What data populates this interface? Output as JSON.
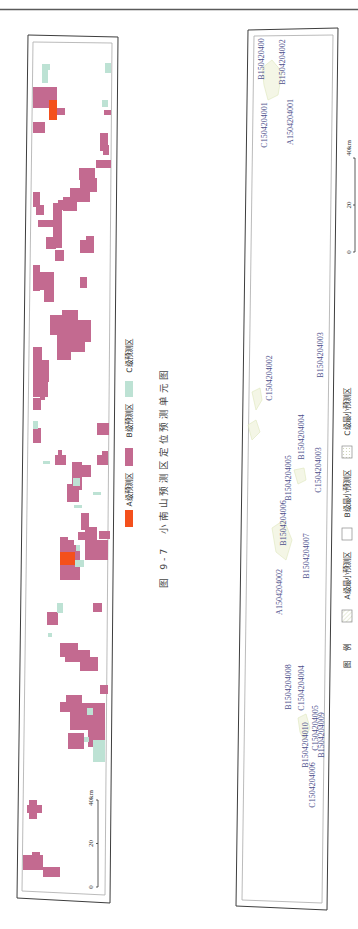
{
  "figure": {
    "number": "图 9-7",
    "title": "小南山预测区定位预测单元图"
  },
  "colors": {
    "A": "#f4501c",
    "B": "#c36a90",
    "C": "#bde2d4",
    "unit_label": "#4d508c",
    "hatch_stroke": "#d9e2b0",
    "hatch_fill": "#f1f4de",
    "box_empty": "#ffffff"
  },
  "left_map": {
    "legend": [
      {
        "key": "A",
        "label": "A级预测区"
      },
      {
        "key": "B",
        "label": "B级预测区"
      },
      {
        "key": "C",
        "label": "C级预测区"
      }
    ],
    "scale": {
      "min": "0",
      "mid": "20",
      "max": "40km"
    },
    "cells": [
      [
        33,
        87,
        24,
        21,
        "B"
      ],
      [
        57,
        108,
        8,
        7,
        "B"
      ],
      [
        104,
        110,
        7,
        5,
        "B"
      ],
      [
        33,
        122,
        12,
        11,
        "B"
      ],
      [
        100,
        133,
        8,
        18,
        "B"
      ],
      [
        103,
        145,
        6,
        10,
        "B"
      ],
      [
        96,
        160,
        15,
        8,
        "B"
      ],
      [
        79,
        168,
        16,
        12,
        "B"
      ],
      [
        80,
        170,
        10,
        20,
        "B"
      ],
      [
        87,
        178,
        10,
        14,
        "B"
      ],
      [
        70,
        188,
        20,
        14,
        "B"
      ],
      [
        63,
        197,
        14,
        14,
        "B"
      ],
      [
        33,
        192,
        7,
        15,
        "B"
      ],
      [
        36,
        205,
        8,
        10,
        "B"
      ],
      [
        38,
        220,
        15,
        7,
        "B"
      ],
      [
        53,
        203,
        9,
        45,
        "B"
      ],
      [
        58,
        200,
        8,
        10,
        "B"
      ],
      [
        46,
        237,
        10,
        12,
        "B"
      ],
      [
        80,
        240,
        14,
        13,
        "B"
      ],
      [
        86,
        236,
        8,
        6,
        "B"
      ],
      [
        55,
        250,
        9,
        11,
        "B"
      ],
      [
        33,
        265,
        7,
        26,
        "B"
      ],
      [
        40,
        272,
        14,
        18,
        "B"
      ],
      [
        44,
        285,
        10,
        17,
        "B"
      ],
      [
        80,
        277,
        7,
        11,
        "B"
      ],
      [
        50,
        315,
        16,
        20,
        "B"
      ],
      [
        62,
        310,
        16,
        12,
        "B"
      ],
      [
        63,
        320,
        28,
        22,
        "B"
      ],
      [
        70,
        340,
        15,
        12,
        "B"
      ],
      [
        57,
        335,
        14,
        25,
        "B"
      ],
      [
        33,
        347,
        9,
        43,
        "B"
      ],
      [
        40,
        360,
        9,
        22,
        "B"
      ],
      [
        33,
        380,
        15,
        17,
        "B"
      ],
      [
        40,
        395,
        5,
        5,
        "B"
      ],
      [
        33,
        398,
        8,
        12,
        "B"
      ],
      [
        33,
        428,
        8,
        15,
        "B"
      ],
      [
        97,
        423,
        12,
        12,
        "B"
      ],
      [
        55,
        455,
        11,
        10,
        "B"
      ],
      [
        58,
        450,
        4,
        5,
        "B"
      ],
      [
        72,
        462,
        10,
        28,
        "B"
      ],
      [
        80,
        465,
        11,
        12,
        "B"
      ],
      [
        67,
        484,
        12,
        18,
        "B"
      ],
      [
        97,
        455,
        11,
        10,
        "B"
      ],
      [
        102,
        451,
        6,
        5,
        "B"
      ],
      [
        81,
        513,
        8,
        17,
        "B"
      ],
      [
        85,
        527,
        12,
        33,
        "B"
      ],
      [
        95,
        540,
        13,
        20,
        "B"
      ],
      [
        99,
        531,
        11,
        8,
        "B"
      ],
      [
        78,
        532,
        8,
        8,
        "B"
      ],
      [
        60,
        537,
        8,
        10,
        "B"
      ],
      [
        60,
        545,
        20,
        35,
        "B"
      ],
      [
        66,
        540,
        8,
        8,
        "B"
      ],
      [
        93,
        603,
        9,
        9,
        "B"
      ],
      [
        47,
        612,
        11,
        13,
        "B"
      ],
      [
        60,
        643,
        18,
        14,
        "B"
      ],
      [
        65,
        650,
        25,
        12,
        "B"
      ],
      [
        80,
        657,
        18,
        14,
        "B"
      ],
      [
        100,
        685,
        8,
        9,
        "B"
      ],
      [
        60,
        702,
        11,
        10,
        "B"
      ],
      [
        66,
        695,
        16,
        12,
        "B"
      ],
      [
        70,
        703,
        35,
        27,
        "B"
      ],
      [
        68,
        733,
        16,
        16,
        "B"
      ],
      [
        88,
        722,
        17,
        25,
        "B"
      ],
      [
        29,
        800,
        8,
        19,
        "B"
      ],
      [
        27,
        805,
        15,
        8,
        "B"
      ],
      [
        23,
        855,
        20,
        15,
        "B"
      ],
      [
        32,
        852,
        8,
        5,
        "B"
      ],
      [
        43,
        867,
        17,
        10,
        "B"
      ],
      [
        42,
        64,
        6,
        19,
        "C"
      ],
      [
        46,
        64,
        4,
        6,
        "C"
      ],
      [
        105,
        63,
        6,
        10,
        "C"
      ],
      [
        102,
        100,
        6,
        7,
        "C"
      ],
      [
        33,
        421,
        5,
        8,
        "C"
      ],
      [
        43,
        461,
        7,
        3,
        "C"
      ],
      [
        93,
        492,
        8,
        3,
        "C"
      ],
      [
        73,
        478,
        7,
        8,
        "C"
      ],
      [
        74,
        505,
        8,
        3,
        "C"
      ],
      [
        75,
        560,
        9,
        7,
        "C"
      ],
      [
        76,
        545,
        4,
        6,
        "C"
      ],
      [
        57,
        603,
        6,
        10,
        "C"
      ],
      [
        48,
        633,
        4,
        4,
        "C"
      ],
      [
        87,
        708,
        6,
        7,
        "C"
      ],
      [
        93,
        740,
        12,
        22,
        "C"
      ],
      [
        84,
        737,
        5,
        5,
        "C"
      ],
      [
        49,
        100,
        8,
        20,
        "A"
      ],
      [
        60,
        552,
        15,
        13,
        "A"
      ]
    ]
  },
  "right_map": {
    "units": [
      {
        "id": "B150420400",
        "x": 261,
        "y": 59
      },
      {
        "id": "B1504204002",
        "x": 282,
        "y": 62
      },
      {
        "id": "C1504204001",
        "x": 264,
        "y": 125
      },
      {
        "id": "A1504204001",
        "x": 290,
        "y": 122
      },
      {
        "id": "B1504204003",
        "x": 320,
        "y": 355
      },
      {
        "id": "C1504204002",
        "x": 269,
        "y": 378
      },
      {
        "id": "B1504204004",
        "x": 301,
        "y": 437
      },
      {
        "id": "C1504204003",
        "x": 318,
        "y": 470
      },
      {
        "id": "B1504204005",
        "x": 288,
        "y": 478
      },
      {
        "id": "B1504204006",
        "x": 283,
        "y": 523
      },
      {
        "id": "B1504204007",
        "x": 306,
        "y": 556
      },
      {
        "id": "A1504204002",
        "x": 279,
        "y": 592
      },
      {
        "id": "B1504204008",
        "x": 288,
        "y": 687
      },
      {
        "id": "C1504204004",
        "x": 301,
        "y": 688
      },
      {
        "id": "C1504204005",
        "x": 315,
        "y": 728
      },
      {
        "id": "B1504204009",
        "x": 321,
        "y": 735
      },
      {
        "id": "B1504204010",
        "x": 305,
        "y": 745
      },
      {
        "id": "C1504204006",
        "x": 312,
        "y": 785
      }
    ],
    "areas": [
      "262,68 272,60 282,72 278,95 268,100 264,85",
      "252,392 260,388 262,400 256,410",
      "248,425 256,420 260,432 252,440",
      "294,470 304,468 306,480 298,484",
      "272,528 284,520 292,540 286,560 276,552",
      "298,718 306,714 310,728 304,740 300,732"
    ],
    "scale": {
      "min": "0",
      "mid": "20",
      "max": "40km"
    },
    "legend": {
      "title": "图 例",
      "items": [
        {
          "key": "A",
          "label": "A级最小预测区"
        },
        {
          "key": "B",
          "label": "B级最小预测区"
        },
        {
          "key": "C",
          "label": "C级最小预测区"
        }
      ]
    }
  }
}
